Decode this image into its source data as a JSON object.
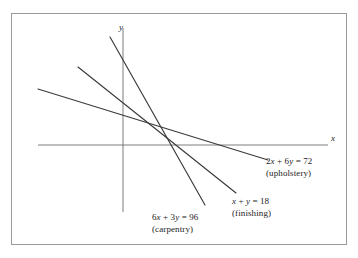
{
  "figure": {
    "background_color": "#ffffff",
    "frame_color": "#9a9a9a",
    "line_color": "#3a3a3a",
    "axis_color": "#6e6e6e",
    "text_color": "#1c1c1c"
  },
  "axes": {
    "x_label": "x",
    "y_label": "y"
  },
  "labels": {
    "upholstery": {
      "equation_lhs": "2x + 6y",
      "equation_eq": " = ",
      "equation_rhs": "72",
      "equation_full": "2x + 6y = 72",
      "name": "(upholstery)"
    },
    "finishing": {
      "equation_lhs": "x + y",
      "equation_eq": " = ",
      "equation_rhs": "18",
      "equation_full": "x + y = 18",
      "name": "(finishing)"
    },
    "carpentry": {
      "equation_lhs": "6x + 3y",
      "equation_eq": " = ",
      "equation_rhs": "96",
      "equation_full": "6x + 3y = 96",
      "name": "(carpentry)"
    }
  },
  "chart_data": {
    "type": "line",
    "title": "",
    "xlabel": "x",
    "ylabel": "y",
    "grid": false,
    "legend": "inline-annotations",
    "series": [
      {
        "name": "2x + 6y = 72",
        "annotation": "(upholstery)",
        "equation": "2x + 6y = 72",
        "slope": -0.3333333333,
        "x_intercept": 36,
        "y_intercept": 12,
        "points": [
          [
            0,
            12
          ],
          [
            36,
            0
          ]
        ],
        "pixel_endpoints": [
          [
            38,
            89
          ],
          [
            268,
            160
          ]
        ]
      },
      {
        "name": "x + y = 18",
        "annotation": "(finishing)",
        "equation": "x + y = 18",
        "slope": -1,
        "x_intercept": 18,
        "y_intercept": 18,
        "points": [
          [
            0,
            18
          ],
          [
            18,
            0
          ]
        ],
        "pixel_endpoints": [
          [
            78,
            67
          ],
          [
            236,
            193
          ]
        ]
      },
      {
        "name": "6x + 3y = 96",
        "annotation": "(carpentry)",
        "equation": "6x + 3y = 96",
        "slope": -2,
        "x_intercept": 16,
        "y_intercept": 32,
        "points": [
          [
            0,
            32
          ],
          [
            16,
            0
          ]
        ],
        "pixel_endpoints": [
          [
            110,
            37
          ],
          [
            205,
            205
          ]
        ]
      }
    ],
    "axis_pixel_geometry": {
      "x_axis": [
        [
          38,
          145
        ],
        [
          328,
          145
        ]
      ],
      "y_axis": [
        [
          123,
          28
        ],
        [
          123,
          212
        ]
      ],
      "origin": [
        123,
        145
      ]
    },
    "intersections": [
      {
        "lines": [
          "x + y = 18",
          "6x + 3y = 96"
        ],
        "point": [
          14,
          4
        ]
      },
      {
        "lines": [
          "x + y = 18",
          "2x + 6y = 72"
        ],
        "point": [
          9,
          9
        ]
      },
      {
        "lines": [
          "6x + 3y = 96",
          "2x + 6y = 72"
        ],
        "point": [
          15,
          7
        ]
      }
    ]
  }
}
